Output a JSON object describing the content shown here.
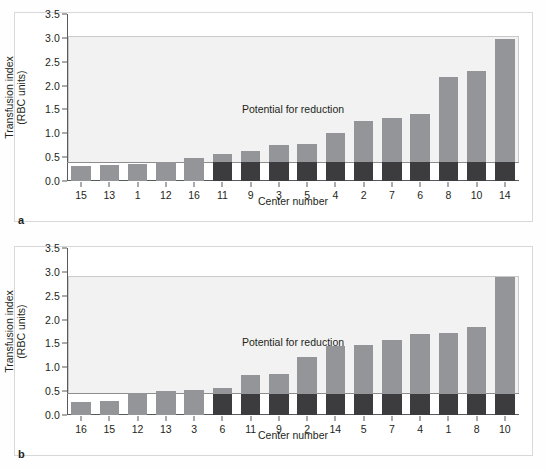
{
  "figure": {
    "background": "#ffffff",
    "bar_color_upper": "#939598",
    "bar_color_base": "#3c3c3f",
    "shade_color": "#f2f2f2"
  },
  "panels": [
    {
      "letter": "a",
      "label": "a",
      "annotation": "Potential for reduction",
      "xlabel": "Center number",
      "ylabel_line1": "Transfusion index",
      "ylabel_line2": "(RBC units)",
      "chart_data": {
        "type": "bar",
        "title": "",
        "xlabel": "Center number",
        "ylabel": "Transfusion index (RBC units)",
        "ylim": [
          0,
          3.5
        ],
        "yticks": [
          "0.0",
          "0.5",
          "1.0",
          "1.5",
          "2.0",
          "2.5",
          "3.0",
          "3.5"
        ],
        "ytick_values": [
          0.0,
          0.5,
          1.0,
          1.5,
          2.0,
          2.5,
          3.0,
          3.5
        ],
        "grid": false,
        "legend": "none",
        "annotation": "Potential for reduction",
        "reference_line": 0.37,
        "shade_top": 3.05,
        "categories": [
          "15",
          "13",
          "1",
          "12",
          "16",
          "11",
          "9",
          "3",
          "5",
          "4",
          "2",
          "7",
          "6",
          "8",
          "10",
          "14"
        ],
        "series": [
          {
            "name": "Benchmark (non-reducible)",
            "color": "#3c3c3f",
            "values": [
              0.0,
              0.0,
              0.0,
              0.0,
              0.0,
              0.4,
              0.4,
              0.4,
              0.4,
              0.4,
              0.4,
              0.4,
              0.4,
              0.4,
              0.4,
              0.4
            ]
          },
          {
            "name": "Reducible transfusion",
            "color": "#939598",
            "values": [
              0.32,
              0.34,
              0.36,
              0.39,
              0.48,
              0.16,
              0.23,
              0.36,
              0.37,
              0.6,
              0.85,
              0.93,
              1.0,
              1.79,
              1.91,
              2.58
            ]
          }
        ],
        "totals": [
          0.32,
          0.34,
          0.36,
          0.39,
          0.48,
          0.56,
          0.63,
          0.76,
          0.77,
          1.0,
          1.25,
          1.33,
          1.4,
          2.19,
          2.31,
          2.98
        ]
      }
    },
    {
      "letter": "b",
      "label": "b",
      "annotation": "Potential for reduction",
      "xlabel": "Center number",
      "ylabel_line1": "Transfusion index",
      "ylabel_line2": "(RBC units)",
      "chart_data": {
        "type": "bar",
        "title": "",
        "xlabel": "Center number",
        "ylabel": "Transfusion index (RBC units)",
        "ylim": [
          0,
          3.5
        ],
        "yticks": [
          "0.0",
          "0.5",
          "1.0",
          "1.5",
          "2.0",
          "2.5",
          "3.0",
          "3.5"
        ],
        "ytick_values": [
          0.0,
          0.5,
          1.0,
          1.5,
          2.0,
          2.5,
          3.0,
          3.5
        ],
        "grid": false,
        "legend": "none",
        "annotation": "Potential for reduction",
        "reference_line": 0.43,
        "shade_top": 2.92,
        "categories": [
          "16",
          "15",
          "12",
          "13",
          "3",
          "6",
          "11",
          "9",
          "2",
          "14",
          "5",
          "7",
          "4",
          "1",
          "8",
          "10"
        ],
        "series": [
          {
            "name": "Benchmark (non-reducible)",
            "color": "#3c3c3f",
            "values": [
              0.0,
              0.0,
              0.0,
              0.0,
              0.0,
              0.45,
              0.45,
              0.45,
              0.45,
              0.45,
              0.45,
              0.45,
              0.45,
              0.45,
              0.45,
              0.45
            ]
          },
          {
            "name": "Reducible transfusion",
            "color": "#939598",
            "values": [
              0.28,
              0.29,
              0.46,
              0.5,
              0.52,
              0.11,
              0.38,
              0.41,
              0.77,
              0.99,
              1.01,
              1.13,
              1.25,
              1.26,
              1.4,
              2.45
            ]
          }
        ],
        "totals": [
          0.28,
          0.29,
          0.46,
          0.5,
          0.52,
          0.56,
          0.83,
          0.86,
          1.22,
          1.44,
          1.46,
          1.58,
          1.7,
          1.71,
          1.85,
          2.9
        ]
      }
    }
  ]
}
